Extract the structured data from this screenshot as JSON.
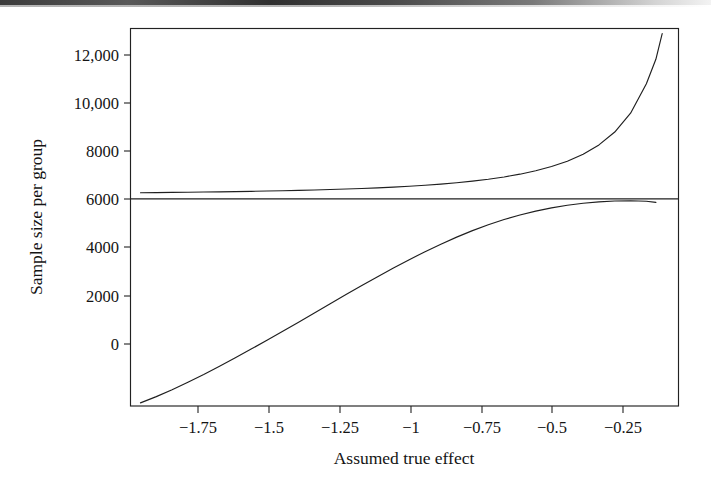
{
  "figure": {
    "background_color": "#ffffff",
    "ink_color": "#1f1f1f",
    "scan_artifact": "dark-band-top-edge"
  },
  "chart_data": {
    "type": "line",
    "title": "",
    "xlabel": "Assumed true effect",
    "ylabel": "Sample size per group",
    "xlim": [
      -1.93,
      -0.2
    ],
    "ylim": [
      -16800,
      13400
    ],
    "grid": false,
    "legend": null,
    "x_ticks": [
      -1.75,
      -1.5,
      -1.25,
      -1,
      -0.75,
      -0.5,
      -0.25
    ],
    "x_tick_labels": [
      "−1.75",
      "−1.5",
      "−1.25",
      "−1",
      "−0.75",
      "−0.5",
      "−0.25"
    ],
    "y_ticks": [
      0,
      2000,
      4000,
      6000,
      8000,
      10000,
      12000
    ],
    "y_tick_labels": [
      "0",
      "2000",
      "4000",
      "6000",
      "8000",
      "10,000",
      "12,000"
    ],
    "annotations": [
      {
        "name": "zero-reference-line",
        "y": -250,
        "style": "solid horizontal line spanning plot width"
      }
    ],
    "series": [
      {
        "name": "required-sample-size-upper-curve",
        "style": "solid",
        "x": [
          -1.9,
          -1.85,
          -1.8,
          -1.75,
          -1.7,
          -1.65,
          -1.6,
          -1.55,
          -1.5,
          -1.45,
          -1.4,
          -1.35,
          -1.3,
          -1.25,
          -1.2,
          -1.15,
          -1.1,
          -1.05,
          -1.0,
          -0.95,
          -0.9,
          -0.85,
          -0.8,
          -0.75,
          -0.7,
          -0.65,
          -0.6,
          -0.55,
          -0.5,
          -0.45,
          -0.4,
          -0.35,
          -0.3,
          -0.27,
          -0.25
        ],
        "values": [
          240,
          250,
          262,
          278,
          295,
          310,
          330,
          350,
          375,
          400,
          430,
          460,
          495,
          535,
          580,
          630,
          690,
          760,
          840,
          930,
          1040,
          1170,
          1320,
          1500,
          1720,
          1990,
          2330,
          2760,
          3320,
          4060,
          5090,
          6590,
          8950,
          10900,
          12950
        ]
      },
      {
        "name": "negative-branch-lower-curve",
        "style": "solid",
        "x": [
          -1.9,
          -1.85,
          -1.8,
          -1.75,
          -1.7,
          -1.65,
          -1.6,
          -1.55,
          -1.5,
          -1.45,
          -1.4,
          -1.35,
          -1.3,
          -1.25,
          -1.2,
          -1.15,
          -1.1,
          -1.05,
          -1.0,
          -0.95,
          -0.9,
          -0.85,
          -0.8,
          -0.75,
          -0.7,
          -0.65,
          -0.6,
          -0.55,
          -0.5,
          -0.45,
          -0.4,
          -0.35,
          -0.3,
          -0.27
        ],
        "values": [
          -16550,
          -16050,
          -15500,
          -14900,
          -14280,
          -13620,
          -12950,
          -12250,
          -11550,
          -10820,
          -10100,
          -9360,
          -8630,
          -7900,
          -7180,
          -6470,
          -5780,
          -5110,
          -4470,
          -3870,
          -3310,
          -2790,
          -2320,
          -1900,
          -1540,
          -1230,
          -970,
          -760,
          -600,
          -490,
          -420,
          -400,
          -440,
          -530
        ]
      }
    ]
  },
  "axes": {
    "y_axis_title": "Sample size per group",
    "x_axis_title": "Assumed true effect"
  }
}
